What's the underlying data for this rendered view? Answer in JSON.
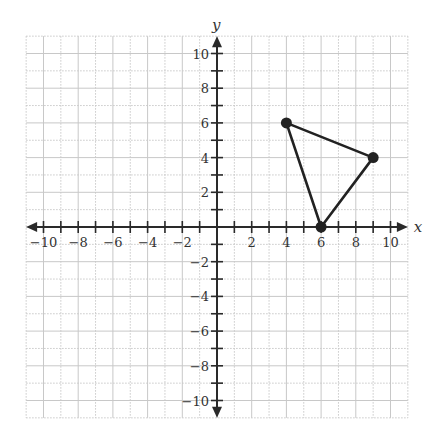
{
  "chart_data": {
    "type": "scatter",
    "title": "",
    "xlabel": "x",
    "ylabel": "y",
    "xlim": [
      -11,
      11
    ],
    "ylim": [
      -11,
      11
    ],
    "grid": true,
    "x_tick_labels": [
      "-10",
      "-8",
      "-6",
      "-4",
      "-2",
      "2",
      "4",
      "6",
      "8",
      "10"
    ],
    "y_tick_labels": [
      "10",
      "8",
      "6",
      "4",
      "2",
      "-2",
      "-4",
      "-6",
      "-8",
      "-10"
    ],
    "series": [
      {
        "name": "triangle",
        "shape": "closed-polygon",
        "points": [
          {
            "x": 4,
            "y": 6
          },
          {
            "x": 9,
            "y": 4
          },
          {
            "x": 6,
            "y": 0
          }
        ]
      }
    ]
  },
  "colors": {
    "grid": "#c8c8c8",
    "axis": "#2a2a2a",
    "polygon": "#222222"
  }
}
